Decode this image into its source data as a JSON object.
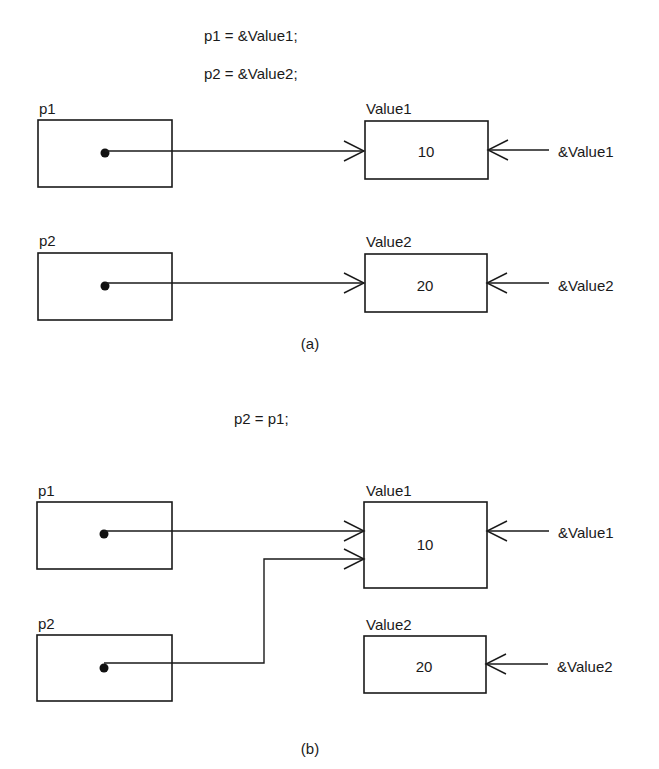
{
  "diagram_a": {
    "code": [
      "p1 = &Value1;",
      "p2 = &Value2;"
    ],
    "caption": "(a)",
    "pointers": [
      {
        "name": "p1",
        "points_to": "Value1"
      },
      {
        "name": "p2",
        "points_to": "Value2"
      }
    ],
    "values": [
      {
        "name": "Value1",
        "value": "10",
        "address_label": "&Value1"
      },
      {
        "name": "Value2",
        "value": "20",
        "address_label": "&Value2"
      }
    ]
  },
  "diagram_b": {
    "code": [
      "p2 = p1;"
    ],
    "caption": "(b)",
    "pointers": [
      {
        "name": "p1",
        "points_to": "Value1"
      },
      {
        "name": "p2",
        "points_to": "Value1"
      }
    ],
    "values": [
      {
        "name": "Value1",
        "value": "10",
        "address_label": "&Value1"
      },
      {
        "name": "Value2",
        "value": "20",
        "address_label": "&Value2"
      }
    ]
  }
}
